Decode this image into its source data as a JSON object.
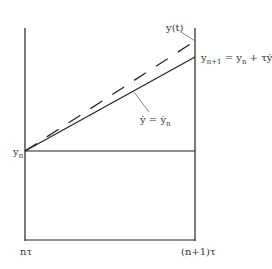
{
  "diagram": {
    "type": "Euler method geometric illustration",
    "labels": {
      "y_t": "y(t)",
      "y_next_lhs": "y",
      "y_next_sub": "n+1",
      "y_next_eq": " = y",
      "y_next_sub2": "n",
      "y_next_plus": " + τẏ",
      "y_next_sub3": "n",
      "slope_lhs": "ẏ = ẏ",
      "slope_sub": "n",
      "y_n": "y",
      "y_n_sub": "n",
      "x_left": "nτ",
      "x_right": "(n+1)τ"
    },
    "lines": {
      "exact_solution": "dashed",
      "euler_step": "solid",
      "baseline": "horizontal at y_n"
    },
    "colors": {
      "line": "#222222",
      "leader": "#666666",
      "text": "#333333"
    }
  }
}
